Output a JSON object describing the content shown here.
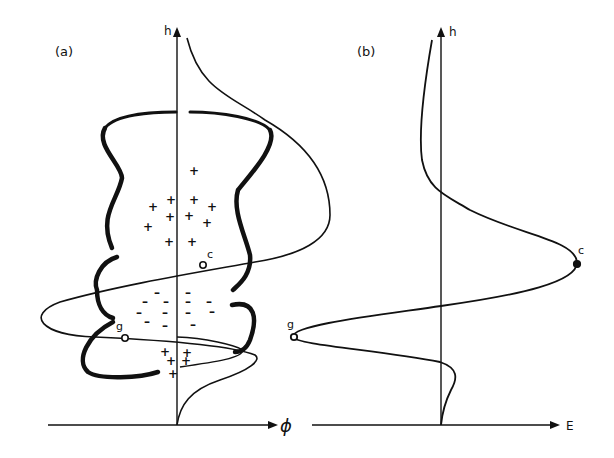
{
  "panels": {
    "a": {
      "label": "(a)",
      "y_axis_label": "h",
      "x_axis_label": "ϕ",
      "point_c": "c",
      "point_g": "g"
    },
    "b": {
      "label": "(b)",
      "y_axis_label": "h",
      "x_axis_label": "E",
      "point_c": "c",
      "point_g": "g"
    }
  },
  "charges": {
    "positive": "+",
    "negative": "–"
  },
  "colors": {
    "ink": "#111111",
    "background": "#ffffff"
  }
}
